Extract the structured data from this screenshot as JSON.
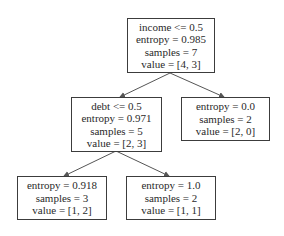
{
  "diagram": {
    "type": "decision-tree",
    "colors": {
      "border": "#3c3c3c",
      "text": "#2a2a2a",
      "edge": "#555555",
      "background": "#ffffff"
    },
    "nodes": {
      "root": {
        "split": "income <= 0.5",
        "entropy": "entropy = 0.985",
        "samples": "samples = 7",
        "value": "value = [4, 3]"
      },
      "left": {
        "split": "debt <= 0.5",
        "entropy": "entropy = 0.971",
        "samples": "samples = 5",
        "value": "value = [2, 3]"
      },
      "right": {
        "entropy": "entropy = 0.0",
        "samples": "samples = 2",
        "value": "value = [2, 0]"
      },
      "left_left": {
        "entropy": "entropy = 0.918",
        "samples": "samples = 3",
        "value": "value = [1, 2]"
      },
      "left_right": {
        "entropy": "entropy = 1.0",
        "samples": "samples = 2",
        "value": "value = [1, 1]"
      }
    },
    "edges": [
      {
        "from": "root",
        "to": "left"
      },
      {
        "from": "root",
        "to": "right"
      },
      {
        "from": "left",
        "to": "left_left"
      },
      {
        "from": "left",
        "to": "left_right"
      }
    ]
  }
}
